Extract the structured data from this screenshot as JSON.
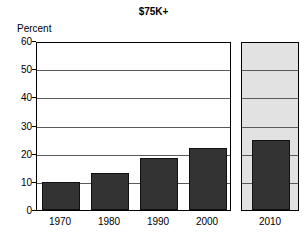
{
  "chart_data": {
    "type": "bar",
    "title": "$75K+",
    "xlabel": "",
    "ylabel": "Percent",
    "ylim": [
      0,
      60
    ],
    "ytick_step": 10,
    "yticks": [
      0,
      10,
      20,
      30,
      40,
      50,
      60
    ],
    "grid": true,
    "legend": "none",
    "categories": [
      "1970",
      "1980",
      "1990",
      "2000",
      "2010"
    ],
    "values": [
      10,
      13,
      18.5,
      22,
      25
    ],
    "series": [
      {
        "name": "Percent of households with income $75K+",
        "values": [
          10,
          13,
          18.5,
          22,
          25
        ]
      }
    ],
    "notes": {
      "projected_category": "2010",
      "projected_panel_shaded": true
    },
    "colors": {
      "bar_fill": "#333333",
      "bar_edge": "#111111",
      "projected_panel_background": "#e2e2e2",
      "gridline": "#5a5a5a",
      "axis": "#000000",
      "plot_background": "#ffffff",
      "text": "#000000"
    }
  }
}
